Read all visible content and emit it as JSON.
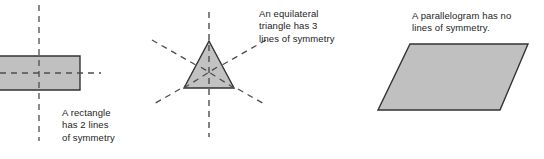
{
  "figure": {
    "background_color": "#ffffff",
    "shape_fill_color": "#c0c0c0",
    "shape_stroke_color": "#333333",
    "symmetry_line_color": "#4d4d4d",
    "caption_text_color": "#1d1d1d",
    "shapes": [
      {
        "id": "rectangle",
        "name": "rectangle",
        "fill": "#c0c0c0",
        "stroke": "#333333",
        "points": "-34,56 80,56 80,90 -34,90",
        "lines_of_symmetry": 2,
        "symmetry_lines": [
          {
            "id": "rectangle-vertical-axis",
            "orientation": "vertical",
            "x1": 39,
            "y1": 5,
            "x2": 39,
            "y2": 141
          },
          {
            "id": "rectangle-horizontal-axis",
            "orientation": "horizontal",
            "x1": 0,
            "y1": 73,
            "x2": 101,
            "y2": 73
          }
        ],
        "caption": {
          "id": "caption-rectangle",
          "lines": [
            "A rectangle",
            "has 2 lines",
            "of symmetry"
          ],
          "text": "A rectangle\nhas 2 lines\nof symmetry"
        }
      },
      {
        "id": "triangle",
        "name": "equilateral triangle",
        "fill": "#c0c0c0",
        "stroke": "#333333",
        "points": "209,41 234,88 184,88",
        "lines_of_symmetry": 3,
        "symmetry_lines": [
          {
            "id": "triangle-vertical-axis",
            "orientation": "vertical",
            "x1": 209,
            "y1": 12,
            "x2": 209,
            "y2": 137
          },
          {
            "id": "triangle-diagonal-axis-left",
            "orientation": "diagonal",
            "x1": 152,
            "y1": 40,
            "x2": 266,
            "y2": 105
          },
          {
            "id": "triangle-diagonal-axis-right",
            "orientation": "diagonal",
            "x1": 266,
            "y1": 40,
            "x2": 152,
            "y2": 105
          }
        ],
        "caption": {
          "id": "caption-triangle",
          "lines": [
            "An equilateral",
            "triangle has 3",
            "lines of symmetry"
          ],
          "text": "An equilateral\ntriangle has 3\nlines of symmetry"
        }
      },
      {
        "id": "parallelogram",
        "name": "parallelogram",
        "fill": "#c0c0c0",
        "stroke": "#333333",
        "points": "410,44 528,44 500,110 378,110",
        "lines_of_symmetry": 0,
        "symmetry_lines": [],
        "caption": {
          "id": "caption-parallelogram",
          "lines": [
            "A parallelogram has no",
            "lines of symmetry."
          ],
          "text": "A parallelogram has no\nlines of symmetry."
        }
      }
    ]
  }
}
